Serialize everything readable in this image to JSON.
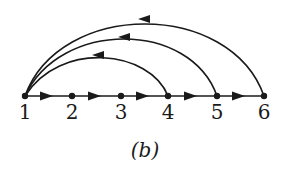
{
  "diagram": {
    "caption": "(b)",
    "nodes": [
      {
        "id": "1",
        "label": "1",
        "x": 25,
        "y": 96
      },
      {
        "id": "2",
        "label": "2",
        "x": 72,
        "y": 96
      },
      {
        "id": "3",
        "label": "3",
        "x": 121,
        "y": 96
      },
      {
        "id": "4",
        "label": "4",
        "x": 168,
        "y": 96
      },
      {
        "id": "5",
        "label": "5",
        "x": 217,
        "y": 96
      },
      {
        "id": "6",
        "label": "6",
        "x": 264,
        "y": 96
      }
    ],
    "edges": [
      {
        "from": "1",
        "to": "2",
        "type": "straight"
      },
      {
        "from": "2",
        "to": "3",
        "type": "straight"
      },
      {
        "from": "3",
        "to": "4",
        "type": "straight"
      },
      {
        "from": "4",
        "to": "5",
        "type": "straight"
      },
      {
        "from": "5",
        "to": "6",
        "type": "straight"
      },
      {
        "from": "4",
        "to": "1",
        "type": "arc"
      },
      {
        "from": "5",
        "to": "1",
        "type": "arc"
      },
      {
        "from": "6",
        "to": "1",
        "type": "arc"
      }
    ]
  }
}
